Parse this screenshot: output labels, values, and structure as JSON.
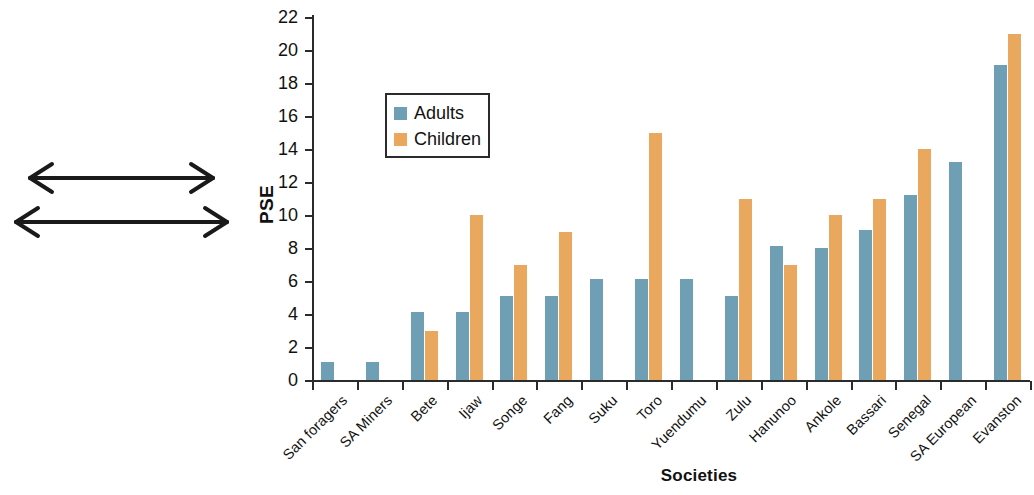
{
  "figure": {
    "illustration": {
      "name": "muller-lyer-illusion",
      "description": "Two horizontal lines of equal length, the upper with outward arrowheads and the lower with inward arrowheads",
      "line_color": "#1a1a1a"
    }
  },
  "legend": {
    "position": "inside-upper-left",
    "entries": [
      {
        "label": "Adults",
        "color": "#6f9fb5"
      },
      {
        "label": "Children",
        "color": "#eaa85e"
      }
    ]
  },
  "chart_data": {
    "type": "bar",
    "title": "",
    "xlabel": "Societies",
    "ylabel": "PSE",
    "ylim": [
      0,
      22
    ],
    "ytick_step": 2,
    "yticks": [
      0,
      2,
      4,
      6,
      8,
      10,
      12,
      14,
      16,
      18,
      20,
      22
    ],
    "grid": false,
    "legend_position": "upper left (inside axes)",
    "categories": [
      "San foragers",
      "SA Miners",
      "Bete",
      "Ijaw",
      "Songe",
      "Fang",
      "Suku",
      "Toro",
      "Yuendumu",
      "Zulu",
      "Hanunoo",
      "Ankole",
      "Bassari",
      "Senegal",
      "SA European",
      "Evanston"
    ],
    "series": [
      {
        "name": "Adults",
        "color": "#6f9fb5",
        "values": [
          1.1,
          1.1,
          4.1,
          4.1,
          5.1,
          5.1,
          6.1,
          6.1,
          6.1,
          5.1,
          8.1,
          8.0,
          9.1,
          11.2,
          13.2,
          19.1
        ]
      },
      {
        "name": "Children",
        "color": "#eaa85e",
        "values": [
          null,
          null,
          3.0,
          10.0,
          7.0,
          9.0,
          null,
          15.0,
          null,
          11.0,
          7.0,
          10.0,
          11.0,
          14.0,
          null,
          21.0
        ]
      }
    ]
  }
}
